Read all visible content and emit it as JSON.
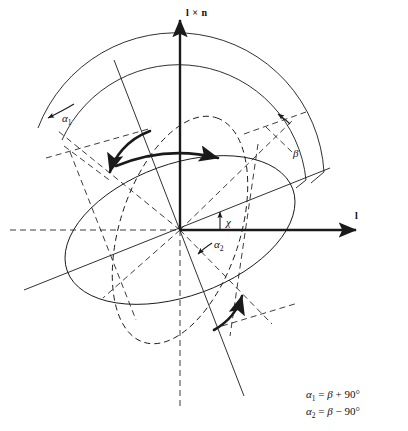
{
  "figure": {
    "background": "#ffffff",
    "stroke_color": "#1a1a1a",
    "axes": [
      {
        "id": "l",
        "label": "l",
        "orientation": "horizontal-right",
        "style": "solid-bold-arrow"
      },
      {
        "id": "lxn",
        "label": "l × n",
        "orientation": "vertical-up",
        "style": "solid-bold-arrow"
      }
    ],
    "angle_labels": [
      {
        "id": "alpha1",
        "text": "α",
        "sub": "1",
        "x": 62,
        "y": 113
      },
      {
        "id": "alpha2",
        "text": "α",
        "sub": "2",
        "x": 214,
        "y": 239
      },
      {
        "id": "beta",
        "text": "β",
        "sub": "",
        "x": 293,
        "y": 148
      },
      {
        "id": "chi",
        "text": "χ",
        "sub": "",
        "x": 226,
        "y": 217
      }
    ],
    "equations": [
      {
        "lhs": "α",
        "lhs_sub": "1",
        "rhs_var": "β",
        "op": "+",
        "value": "90°"
      },
      {
        "lhs": "α",
        "lhs_sub": "2",
        "rhs_var": "β",
        "op": "−",
        "value": "90°"
      }
    ],
    "elements": {
      "outer_arc": "large circular arc spanning upper region",
      "inner_arc": "second concentric arc terminating at beta wedge",
      "solid_ellipse": "tilted solid ellipse centered at origin",
      "dashed_ellipse": "tilted dashed ellipse centered at origin",
      "curved_arrows": 3,
      "origin": {
        "x": 180,
        "y": 230
      }
    }
  }
}
